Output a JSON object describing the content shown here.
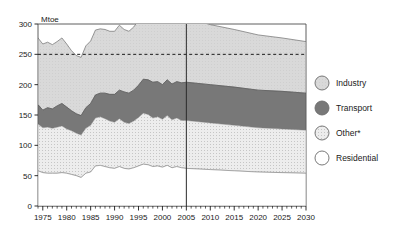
{
  "chart_data": {
    "type": "area",
    "title": "",
    "xlabel": "",
    "ylabel": "Mtoe",
    "unit": "Mtoe",
    "stacked": true,
    "grid": false,
    "xlim": [
      1974,
      2030
    ],
    "ylim": [
      0,
      300
    ],
    "ytick_labels": [
      "0",
      "50",
      "100",
      "150",
      "200",
      "250",
      "300"
    ],
    "yticks": [
      0,
      50,
      100,
      150,
      200,
      250,
      300
    ],
    "xtick_labels": [
      "1975",
      "1980",
      "1985",
      "1990",
      "1995",
      "2000",
      "2005",
      "2010",
      "2015",
      "2020",
      "2025",
      "2030"
    ],
    "xticks": [
      1975,
      1980,
      1985,
      1990,
      1995,
      2000,
      2005,
      2010,
      2015,
      2020,
      2025,
      2030
    ],
    "minor_xtick_step": 1,
    "reference_line": {
      "value": 250,
      "style": "dashed",
      "label": ""
    },
    "divider_line": {
      "value": 2005,
      "style": "solid",
      "label": ""
    },
    "legend_position": "right",
    "series": [
      {
        "name": "Residential",
        "order": 1,
        "color": "#ffffff",
        "x": [
          1974,
          1975,
          1976,
          1977,
          1978,
          1979,
          1980,
          1981,
          1982,
          1983,
          1984,
          1985,
          1986,
          1987,
          1988,
          1989,
          1990,
          1991,
          1992,
          1993,
          1994,
          1995,
          1996,
          1997,
          1998,
          1999,
          2000,
          2001,
          2002,
          2003,
          2004,
          2005,
          2010,
          2015,
          2020,
          2025,
          2030
        ],
        "values": [
          58,
          55,
          54,
          54,
          54,
          55,
          54,
          52,
          50,
          47,
          54,
          56,
          66,
          67,
          65,
          63,
          62,
          65,
          62,
          61,
          63,
          66,
          69,
          68,
          65,
          66,
          64,
          67,
          63,
          65,
          63,
          62,
          60,
          58,
          56,
          55,
          54
        ]
      },
      {
        "name": "Other*",
        "order": 2,
        "color": "#e4e4e4",
        "x": [
          1974,
          1975,
          1976,
          1977,
          1978,
          1979,
          1980,
          1981,
          1982,
          1983,
          1984,
          1985,
          1986,
          1987,
          1988,
          1989,
          1990,
          1991,
          1992,
          1993,
          1994,
          1995,
          1996,
          1997,
          1998,
          1999,
          2000,
          2001,
          2002,
          2003,
          2004,
          2005,
          2010,
          2015,
          2020,
          2025,
          2030
        ],
        "values": [
          77,
          74,
          76,
          74,
          76,
          77,
          73,
          72,
          70,
          70,
          74,
          77,
          79,
          80,
          79,
          77,
          76,
          79,
          76,
          75,
          77,
          80,
          84,
          83,
          80,
          81,
          79,
          82,
          79,
          80,
          78,
          79,
          77,
          75,
          73,
          72,
          71
        ]
      },
      {
        "name": "Transport",
        "order": 3,
        "color": "#787878",
        "x": [
          1974,
          1975,
          1976,
          1977,
          1978,
          1979,
          1980,
          1981,
          1982,
          1983,
          1984,
          1985,
          1986,
          1987,
          1988,
          1989,
          1990,
          1991,
          1992,
          1993,
          1994,
          1995,
          1996,
          1997,
          1998,
          1999,
          2000,
          2001,
          2002,
          2003,
          2004,
          2005,
          2010,
          2015,
          2020,
          2025,
          2030
        ],
        "values": [
          32,
          29,
          32,
          32,
          35,
          37,
          36,
          33,
          32,
          32,
          34,
          36,
          38,
          39,
          42,
          44,
          46,
          47,
          50,
          50,
          51,
          53,
          56,
          57,
          59,
          58,
          57,
          59,
          59,
          60,
          62,
          63,
          63,
          63,
          62,
          62,
          61
        ]
      },
      {
        "name": "Industry",
        "order": 4,
        "color": "#d4d4d4",
        "x": [
          1974,
          1975,
          1976,
          1977,
          1978,
          1979,
          1980,
          1981,
          1982,
          1983,
          1984,
          1985,
          1986,
          1987,
          1988,
          1989,
          1990,
          1991,
          1992,
          1993,
          1994,
          1995,
          1996,
          1997,
          1998,
          1999,
          2000,
          2001,
          2002,
          2003,
          2004,
          2005,
          2010,
          2015,
          2020,
          2025,
          2030
        ],
        "values": [
          110,
          109,
          108,
          106,
          106,
          108,
          104,
          99,
          96,
          96,
          102,
          103,
          107,
          106,
          105,
          104,
          104,
          107,
          103,
          102,
          104,
          107,
          110,
          108,
          105,
          106,
          104,
          106,
          103,
          105,
          104,
          106,
          99,
          95,
          91,
          88,
          85
        ]
      }
    ],
    "stack_tops": {
      "note": "cumulative totals used for band boundaries",
      "total": [
        277,
        267,
        270,
        266,
        271,
        277,
        267,
        256,
        248,
        245,
        264,
        272,
        290,
        292,
        291,
        288,
        288,
        298,
        291,
        288,
        295,
        306,
        319,
        316,
        309,
        311,
        304,
        314,
        300,
        310,
        307,
        310,
        299,
        291,
        282,
        277,
        271
      ]
    },
    "legend": [
      {
        "label": "Industry",
        "color": "#d4d4d4",
        "pattern": "solid"
      },
      {
        "label": "Transport",
        "color": "#787878",
        "pattern": "solid"
      },
      {
        "label": "Other*",
        "color": "#e4e4e4",
        "pattern": "dotted"
      },
      {
        "label": "Residential",
        "color": "#ffffff",
        "pattern": "none"
      }
    ]
  }
}
